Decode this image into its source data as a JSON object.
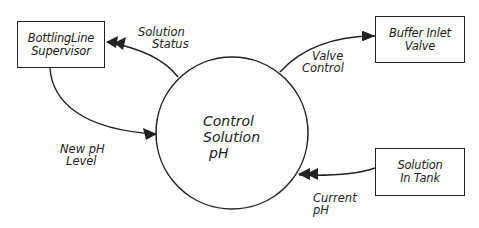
{
  "diagram": {
    "type": "context-data-flow-diagram",
    "process": {
      "lines": [
        "Control",
        "Solution",
        "pH"
      ]
    },
    "entities": [
      {
        "id": "supervisor",
        "lines": [
          "BottlingLine",
          "Supervisor"
        ]
      },
      {
        "id": "valve",
        "lines": [
          "Buffer Inlet",
          "Valve"
        ]
      },
      {
        "id": "tank",
        "lines": [
          "Solution",
          "In Tank"
        ]
      }
    ],
    "flows": [
      {
        "id": "solution-status",
        "from": "process",
        "to": "supervisor",
        "lines": [
          "Solution",
          "Status"
        ]
      },
      {
        "id": "new-ph-level",
        "from": "supervisor",
        "to": "process",
        "lines": [
          "New pH",
          "Level"
        ]
      },
      {
        "id": "valve-control",
        "from": "process",
        "to": "valve",
        "lines": [
          "Valve",
          "Control"
        ]
      },
      {
        "id": "current-ph",
        "from": "tank",
        "to": "process",
        "lines": [
          "Current",
          "pH"
        ]
      }
    ],
    "colors": {
      "stroke": "#222222",
      "background": "#ffffff"
    }
  }
}
